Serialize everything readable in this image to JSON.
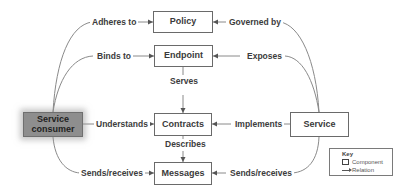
{
  "diagram": {
    "components": {
      "policy": "Policy",
      "endpoint": "Endpoint",
      "contracts": "Contracts",
      "messages": "Messages",
      "service_consumer": "Service consumer",
      "service": "Service"
    },
    "relations": {
      "adheres_to": "Adheres to",
      "binds_to": "Binds to",
      "understands": "Understands",
      "consumer_sends_receives": "Sends/receives",
      "governed_by": "Governed by",
      "exposes": "Exposes",
      "implements": "Implements",
      "service_sends_receives": "Sends/receives",
      "serves": "Serves",
      "describes": "Describes"
    },
    "edges": [
      {
        "from": "Service consumer",
        "to": "Policy",
        "label": "Adheres to"
      },
      {
        "from": "Service consumer",
        "to": "Endpoint",
        "label": "Binds to"
      },
      {
        "from": "Service consumer",
        "to": "Contracts",
        "label": "Understands"
      },
      {
        "from": "Service consumer",
        "to": "Messages",
        "label": "Sends/receives"
      },
      {
        "from": "Service",
        "to": "Policy",
        "label": "Governed by"
      },
      {
        "from": "Service",
        "to": "Endpoint",
        "label": "Exposes"
      },
      {
        "from": "Service",
        "to": "Contracts",
        "label": "Implements"
      },
      {
        "from": "Service",
        "to": "Messages",
        "label": "Sends/receives"
      },
      {
        "from": "Endpoint",
        "to": "Contracts",
        "label": "Serves"
      },
      {
        "from": "Contracts",
        "to": "Messages",
        "label": "Describes"
      }
    ],
    "key": {
      "title": "Key",
      "component": "Component",
      "relation": "Relation"
    },
    "colors": {
      "line": "#8a8a8a",
      "box_border": "#6a6a6a",
      "consumer_fill": "#8e8e8e",
      "text": "#3a3a3a"
    }
  }
}
